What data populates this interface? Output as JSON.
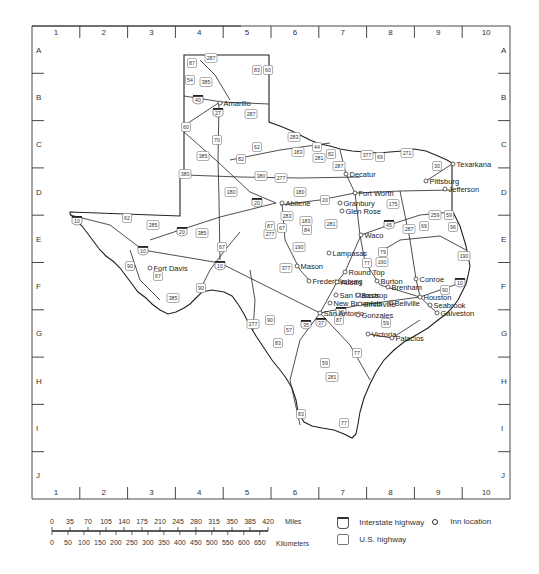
{
  "grid": {
    "columns": [
      "1",
      "2",
      "3",
      "4",
      "5",
      "6",
      "7",
      "8",
      "9",
      "10"
    ],
    "rows": [
      "A",
      "B",
      "C",
      "D",
      "E",
      "F",
      "G",
      "H",
      "I",
      "J"
    ]
  },
  "cities": [
    {
      "name": "Amarillo",
      "x": 220,
      "y": 103
    },
    {
      "name": "Texarkana",
      "x": 453,
      "y": 164
    },
    {
      "name": "Decatur",
      "x": 346,
      "y": 174
    },
    {
      "name": "Pittsburg",
      "x": 426,
      "y": 181
    },
    {
      "name": "Jefferson",
      "x": 445,
      "y": 189
    },
    {
      "name": "Fort Worth",
      "x": 355,
      "y": 193
    },
    {
      "name": "Abilene",
      "x": 282,
      "y": 203
    },
    {
      "name": "Granbury",
      "x": 340,
      "y": 203
    },
    {
      "name": "Glen Rose",
      "x": 342,
      "y": 211
    },
    {
      "name": "Waco",
      "x": 361,
      "y": 235
    },
    {
      "name": "Fort Davis",
      "x": 150,
      "y": 268
    },
    {
      "name": "Lampasas",
      "x": 329,
      "y": 253
    },
    {
      "name": "Mason",
      "x": 297,
      "y": 266
    },
    {
      "name": "Round Top",
      "x": 345,
      "y": 272
    },
    {
      "name": "Conroe",
      "x": 416,
      "y": 279
    },
    {
      "name": "Fredericksburg",
      "x": 309,
      "y": 281
    },
    {
      "name": "Austin",
      "x": 337,
      "y": 282
    },
    {
      "name": "Burton",
      "x": 377,
      "y": 281
    },
    {
      "name": "Brenham",
      "x": 388,
      "y": 287
    },
    {
      "name": "San Marcos",
      "x": 336,
      "y": 295
    },
    {
      "name": "Bastrop",
      "x": 358,
      "y": 295
    },
    {
      "name": "Houston",
      "x": 420,
      "y": 297
    },
    {
      "name": "Bellville",
      "x": 391,
      "y": 303
    },
    {
      "name": "Seabrook",
      "x": 430,
      "y": 305
    },
    {
      "name": "New Braunfels",
      "x": 330,
      "y": 303
    },
    {
      "name": "Smithville",
      "x": 360,
      "y": 304
    },
    {
      "name": "Galveston",
      "x": 437,
      "y": 313
    },
    {
      "name": "San Antonio",
      "x": 320,
      "y": 313
    },
    {
      "name": "Gonzales",
      "x": 358,
      "y": 315
    },
    {
      "name": "Victoria",
      "x": 368,
      "y": 334
    },
    {
      "name": "Palacios",
      "x": 392,
      "y": 338
    }
  ],
  "interstates": [
    {
      "num": "40",
      "x": 198,
      "y": 100
    },
    {
      "num": "27",
      "x": 218,
      "y": 113
    },
    {
      "num": "20",
      "x": 257,
      "y": 203
    },
    {
      "num": "20",
      "x": 182,
      "y": 232
    },
    {
      "name": "",
      "num": "10",
      "x": 77,
      "y": 221
    },
    {
      "num": "10",
      "x": 143,
      "y": 251
    },
    {
      "num": "10",
      "x": 220,
      "y": 266
    },
    {
      "num": "35",
      "x": 306,
      "y": 325
    },
    {
      "num": "37",
      "x": 321,
      "y": 323
    },
    {
      "num": "10",
      "x": 341,
      "y": 312
    },
    {
      "num": "45",
      "x": 389,
      "y": 225
    },
    {
      "num": "10",
      "x": 460,
      "y": 283
    }
  ],
  "us_highways": [
    {
      "num": "287",
      "x": 211,
      "y": 58
    },
    {
      "num": "87",
      "x": 192,
      "y": 63
    },
    {
      "num": "83",
      "x": 257,
      "y": 70
    },
    {
      "num": "60",
      "x": 268,
      "y": 70
    },
    {
      "num": "54",
      "x": 190,
      "y": 80
    },
    {
      "num": "385",
      "x": 206,
      "y": 82
    },
    {
      "num": "287",
      "x": 251,
      "y": 114
    },
    {
      "num": "60",
      "x": 186,
      "y": 127
    },
    {
      "num": "70",
      "x": 217,
      "y": 140
    },
    {
      "num": "62",
      "x": 257,
      "y": 147
    },
    {
      "num": "385",
      "x": 203,
      "y": 156
    },
    {
      "num": "82",
      "x": 241,
      "y": 159
    },
    {
      "num": "380",
      "x": 185,
      "y": 174
    },
    {
      "num": "380",
      "x": 261,
      "y": 176
    },
    {
      "num": "180",
      "x": 231,
      "y": 192
    },
    {
      "num": "283",
      "x": 294,
      "y": 137
    },
    {
      "num": "183",
      "x": 298,
      "y": 152
    },
    {
      "num": "44",
      "x": 317,
      "y": 147
    },
    {
      "num": "281",
      "x": 319,
      "y": 158
    },
    {
      "num": "82",
      "x": 331,
      "y": 154
    },
    {
      "num": "287",
      "x": 339,
      "y": 166
    },
    {
      "num": "377",
      "x": 367,
      "y": 155
    },
    {
      "num": "69",
      "x": 380,
      "y": 157
    },
    {
      "num": "271",
      "x": 407,
      "y": 153
    },
    {
      "num": "30",
      "x": 437,
      "y": 166
    },
    {
      "num": "277",
      "x": 281,
      "y": 178
    },
    {
      "num": "180",
      "x": 300,
      "y": 192
    },
    {
      "num": "20",
      "x": 325,
      "y": 200
    },
    {
      "num": "175",
      "x": 393,
      "y": 204
    },
    {
      "num": "259",
      "x": 435,
      "y": 215
    },
    {
      "num": "59",
      "x": 449,
      "y": 215
    },
    {
      "num": "283",
      "x": 287,
      "y": 216
    },
    {
      "num": "183",
      "x": 306,
      "y": 221
    },
    {
      "num": "281",
      "x": 331,
      "y": 224
    },
    {
      "num": "67",
      "x": 282,
      "y": 228
    },
    {
      "num": "84",
      "x": 307,
      "y": 230
    },
    {
      "num": "287",
      "x": 409,
      "y": 229
    },
    {
      "name": "",
      "num": "69",
      "x": 424,
      "y": 226
    },
    {
      "num": "96",
      "x": 453,
      "y": 227
    },
    {
      "num": "190",
      "x": 299,
      "y": 247
    },
    {
      "num": "79",
      "x": 383,
      "y": 252
    },
    {
      "num": "190",
      "x": 382,
      "y": 262
    },
    {
      "num": "77",
      "x": 367,
      "y": 263
    },
    {
      "num": "190",
      "x": 464,
      "y": 256
    },
    {
      "num": "277",
      "x": 270,
      "y": 234
    },
    {
      "num": "87",
      "x": 270,
      "y": 226
    },
    {
      "num": "377",
      "x": 286,
      "y": 268
    },
    {
      "num": "90",
      "x": 445,
      "y": 290
    },
    {
      "num": "62",
      "x": 127,
      "y": 218
    },
    {
      "num": "285",
      "x": 153,
      "y": 225
    },
    {
      "num": "385",
      "x": 202,
      "y": 233
    },
    {
      "num": "67",
      "x": 222,
      "y": 247
    },
    {
      "num": "90",
      "x": 130,
      "y": 266
    },
    {
      "num": "67",
      "x": 158,
      "y": 276
    },
    {
      "num": "385",
      "x": 173,
      "y": 298
    },
    {
      "num": "90",
      "x": 201,
      "y": 288
    },
    {
      "num": "277",
      "x": 253,
      "y": 324
    },
    {
      "num": "90",
      "x": 270,
      "y": 320
    },
    {
      "num": "57",
      "x": 289,
      "y": 330
    },
    {
      "num": "83",
      "x": 278,
      "y": 343
    },
    {
      "num": "87",
      "x": 339,
      "y": 320
    },
    {
      "num": "59",
      "x": 386,
      "y": 323
    },
    {
      "num": "77",
      "x": 357,
      "y": 353
    },
    {
      "num": "59",
      "x": 325,
      "y": 363
    },
    {
      "num": "281",
      "x": 332,
      "y": 377
    },
    {
      "num": "83",
      "x": 301,
      "y": 414
    },
    {
      "num": "77",
      "x": 344,
      "y": 423
    }
  ],
  "scale_bar": {
    "miles_ticks": [
      "0",
      "35",
      "70",
      "105",
      "140",
      "175",
      "210",
      "245",
      "280",
      "315",
      "350",
      "385",
      "420"
    ],
    "miles_label": "Miles",
    "km_ticks": [
      "0",
      "50",
      "100",
      "150",
      "200",
      "250",
      "300",
      "350",
      "400",
      "450",
      "500",
      "550",
      "600",
      "650"
    ],
    "km_label": "Kilometers"
  },
  "legend": {
    "interstate_label": "Interstate highway",
    "us_label": "U.S. highway",
    "inn_label": "Inn location",
    "shield_placeholder": "nnn"
  }
}
